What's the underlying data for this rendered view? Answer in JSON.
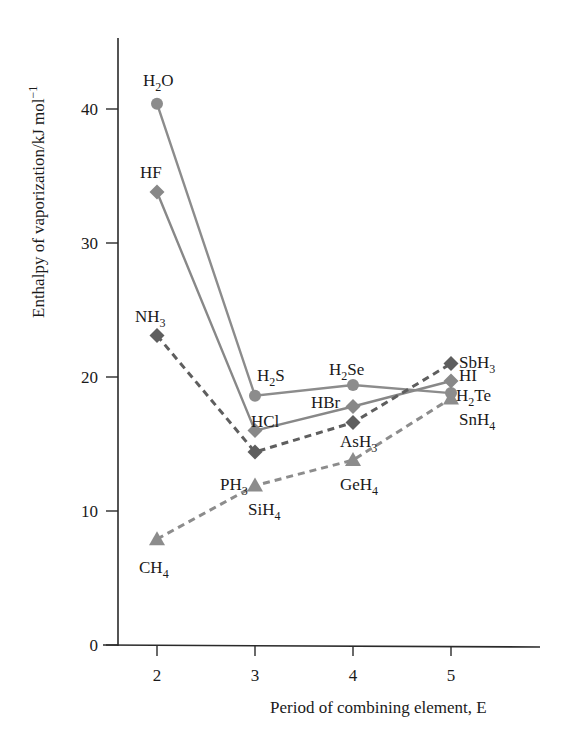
{
  "chart_data": {
    "type": "line",
    "title": "",
    "xlabel": "Period of combining element, E",
    "ylabel": "Enthalpy of vaporization/kJ mol⁻¹",
    "x": [
      2,
      3,
      4,
      5
    ],
    "xlim": [
      1.5,
      5.9
    ],
    "ylim": [
      0,
      45
    ],
    "xticks": [
      2,
      3,
      4,
      5
    ],
    "yticks": [
      0,
      10,
      20,
      30,
      40
    ],
    "grid": false,
    "legend": "none (points labelled directly)",
    "series": [
      {
        "name": "Group 16 hydrides",
        "marker": "circle",
        "line": "solid",
        "color": "#8c8c8c",
        "labels": [
          "H2O",
          "H2S",
          "H2Se",
          "H2Te"
        ],
        "values": [
          40.4,
          18.6,
          19.4,
          18.8
        ]
      },
      {
        "name": "Group 17 hydrides",
        "marker": "diamond",
        "line": "solid",
        "color": "#888888",
        "labels": [
          "HF",
          "HCl",
          "HBr",
          "HI"
        ],
        "values": [
          33.8,
          16.0,
          17.8,
          19.7
        ]
      },
      {
        "name": "Group 15 hydrides",
        "marker": "diamond",
        "line": "dashed",
        "color": "#5e5e5e",
        "labels": [
          "NH3",
          "PH3",
          "AsH3",
          "SbH3"
        ],
        "values": [
          23.1,
          14.4,
          16.6,
          21.0
        ]
      },
      {
        "name": "Group 14 hydrides",
        "marker": "triangle",
        "line": "dashed",
        "color": "#8c8c8c",
        "labels": [
          "CH4",
          "SiH4",
          "GeH4",
          "SnH4"
        ],
        "values": [
          7.9,
          11.9,
          13.8,
          18.4
        ]
      }
    ]
  },
  "labels": {
    "H2O": {
      "main": "H",
      "sub": "2",
      "tail": "O",
      "dx": -14,
      "dy": -18
    },
    "HF": {
      "main": "HF",
      "sub": "",
      "tail": "",
      "dx": -17,
      "dy": -14
    },
    "NH3": {
      "main": "NH",
      "sub": "3",
      "tail": "",
      "dx": -22,
      "dy": -13
    },
    "CH4": {
      "main": "CH",
      "sub": "4",
      "tail": "",
      "dx": -18,
      "dy": 34
    },
    "H2S": {
      "main": "H",
      "sub": "2",
      "tail": "S",
      "dx": 2,
      "dy": -15
    },
    "HCl": {
      "main": "HCl",
      "sub": "",
      "tail": "",
      "dx": -4,
      "dy": -4
    },
    "PH3": {
      "main": "PH",
      "sub": "3",
      "tail": "",
      "dx": -35,
      "dy": 38
    },
    "SiH4": {
      "main": "SiH",
      "sub": "4",
      "tail": "",
      "dx": -7,
      "dy": 29
    },
    "H2Se": {
      "main": "H",
      "sub": "2",
      "tail": "Se",
      "dx": -24,
      "dy": -10
    },
    "HBr": {
      "main": "HBr",
      "sub": "",
      "tail": "",
      "dx": -42,
      "dy": 2
    },
    "AsH3": {
      "main": "AsH",
      "sub": "3",
      "tail": "",
      "dx": -13,
      "dy": 24
    },
    "GeH4": {
      "main": "GeH",
      "sub": "4",
      "tail": "",
      "dx": -13,
      "dy": 30
    },
    "SbH3": {
      "main": "SbH",
      "sub": "3",
      "tail": "",
      "dx": 8,
      "dy": 4
    },
    "HI": {
      "main": "HI",
      "sub": "",
      "tail": "",
      "dx": 8,
      "dy": 0
    },
    "H2Te": {
      "main": "H",
      "sub": "2",
      "tail": "Te",
      "dx": 5,
      "dy": 8
    },
    "SnH4": {
      "main": "SnH",
      "sub": "4",
      "tail": "",
      "dx": 8,
      "dy": 27
    }
  },
  "layout": {
    "axis_color": "#2a2a2a",
    "plot_left": 118,
    "plot_bottom": 645,
    "plot_top": 38,
    "plot_right": 540,
    "x_px_per_unit": 98,
    "x_origin_value": 2,
    "x_origin_px": 157,
    "y_px_per_unit": 13.4
  }
}
